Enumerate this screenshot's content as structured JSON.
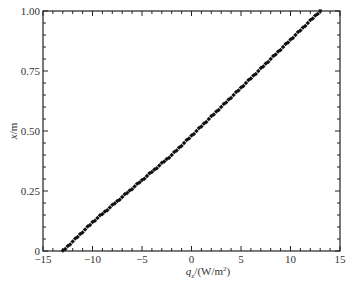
{
  "chart_data": {
    "type": "scatter",
    "title": "",
    "xlabel": "q_z/(W/m²)",
    "ylabel": "x/m",
    "xlim": [
      -15,
      15
    ],
    "ylim": [
      0,
      1.0
    ],
    "xticks": [
      "-15",
      "-10",
      "-5",
      "0",
      "5",
      "10",
      "15"
    ],
    "yticks": [
      "0",
      "0.25",
      "0.50",
      "0.75",
      "1.00"
    ],
    "grid": false,
    "legend": null,
    "series": [
      {
        "name": "data",
        "marker": "square",
        "color": "#111111",
        "x": [
          -13.0,
          -12.0,
          -11.0,
          -10.0,
          -9.0,
          -8.0,
          -7.0,
          -6.0,
          -5.0,
          -4.0,
          -3.0,
          -2.0,
          -1.0,
          0.0,
          1.0,
          2.0,
          3.0,
          4.0,
          5.0,
          6.0,
          7.0,
          8.0,
          9.0,
          10.0,
          11.0,
          12.0,
          13.0
        ],
        "y": [
          0.0,
          0.04,
          0.08,
          0.12,
          0.155,
          0.19,
          0.225,
          0.26,
          0.295,
          0.33,
          0.365,
          0.4,
          0.44,
          0.48,
          0.52,
          0.56,
          0.6,
          0.64,
          0.68,
          0.72,
          0.76,
          0.8,
          0.84,
          0.88,
          0.92,
          0.96,
          1.0
        ]
      }
    ]
  },
  "axes": {
    "xlabel_main": "q",
    "xlabel_sub": "z",
    "xlabel_unit": "/(W/m",
    "xlabel_sup": "2",
    "xlabel_close": ")",
    "ylabel_var": "x",
    "ylabel_unit": "/m"
  },
  "caption": ""
}
